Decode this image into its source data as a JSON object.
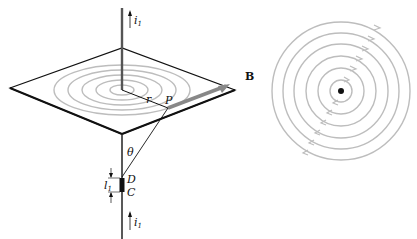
{
  "figure": {
    "left_panel": {
      "labels": {
        "current_top": "i",
        "current_top_sub": "1",
        "radius": "r",
        "point": "P",
        "field": "B",
        "angle": "θ",
        "segment_end_top": "D",
        "segment_end_bottom": "C",
        "segment_length": "l",
        "segment_length_sub": "1",
        "current_bottom": "i",
        "current_bottom_sub": "1"
      }
    },
    "right_panel": {
      "description": "concentric magnetic field circles around wire (top view)",
      "circle_count": 6
    },
    "colors": {
      "line": "#111111",
      "field_lines": "#b8b8b8",
      "b_vector": "#8a8a8a"
    }
  }
}
